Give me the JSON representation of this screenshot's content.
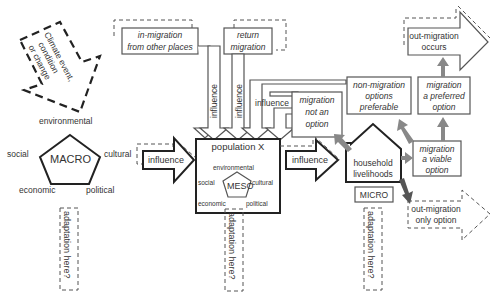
{
  "diagram": {
    "climate_box": {
      "label_lines": [
        "Climate event,",
        "condition",
        "or change"
      ]
    },
    "macro": {
      "label": "MACRO",
      "dimensions": {
        "top": "environmental",
        "left": "social",
        "right": "cultural",
        "bottom_left": "economic",
        "bottom_right": "political"
      },
      "adaptation": "adaptation here?"
    },
    "influence_arrows": {
      "macro_to_meso": "influence",
      "in_migration": "influence",
      "return_migration": "influence",
      "non_migration": "influence",
      "meso_to_micro": "influence"
    },
    "in_migration_box": {
      "lines": [
        "in-migration",
        "from other places"
      ]
    },
    "return_migration_box": {
      "lines": [
        "return",
        "migration"
      ]
    },
    "population": {
      "title": "population X",
      "meso_label": "MESO",
      "dimensions": {
        "top": "environmental",
        "left": "social",
        "right": "cultural",
        "bottom_left": "economic",
        "bottom_right": "political"
      },
      "adaptation": "adaptation here?"
    },
    "household": {
      "lines": [
        "household",
        "livelihoods"
      ],
      "micro_label": "MICRO",
      "adaptation": "adaptation here?"
    },
    "outcomes": {
      "not_an_option": [
        "migration",
        "not an",
        "option"
      ],
      "non_migration_preferable": [
        "non-migration",
        "options",
        "preferable"
      ],
      "preferred_option": [
        "migration",
        "a preferred",
        "option"
      ],
      "viable_option": [
        "migration",
        "a viable",
        "option"
      ],
      "out_migration_occurs": [
        "out-migration",
        "occurs"
      ],
      "out_migration_only_option": [
        "out-migration",
        "only option"
      ]
    },
    "colors": {
      "line": "#555555",
      "bold_line": "#222222",
      "grey_arrow": "#888888",
      "text": "#333333"
    }
  }
}
